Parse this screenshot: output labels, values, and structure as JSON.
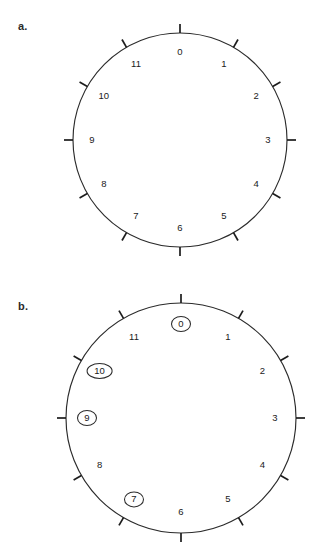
{
  "figure": {
    "background_color": "#ffffff",
    "line_color": "#2b2b2b",
    "text_color": "#1a1a1a"
  },
  "panels": [
    {
      "id": "a",
      "label": "a.",
      "label_x": 18,
      "label_y": 20,
      "dial": {
        "center_x": 180,
        "center_y": 140,
        "radius": 107,
        "tick_inner_offset": 0,
        "tick_outer_offset": 9,
        "label_inset": 19
      },
      "hours": [
        {
          "value": "0",
          "angle_deg": 0,
          "marked": false
        },
        {
          "value": "1",
          "angle_deg": 30,
          "marked": false
        },
        {
          "value": "2",
          "angle_deg": 60,
          "marked": false
        },
        {
          "value": "3",
          "angle_deg": 90,
          "marked": false
        },
        {
          "value": "4",
          "angle_deg": 120,
          "marked": false
        },
        {
          "value": "5",
          "angle_deg": 150,
          "marked": false
        },
        {
          "value": "6",
          "angle_deg": 180,
          "marked": false
        },
        {
          "value": "7",
          "angle_deg": 210,
          "marked": false
        },
        {
          "value": "8",
          "angle_deg": 240,
          "marked": false
        },
        {
          "value": "9",
          "angle_deg": 270,
          "marked": false
        },
        {
          "value": "10",
          "angle_deg": 300,
          "marked": false
        },
        {
          "value": "11",
          "angle_deg": 330,
          "marked": false
        }
      ]
    },
    {
      "id": "b",
      "label": "b.",
      "label_x": 18,
      "label_y": 300,
      "dial": {
        "center_x": 181,
        "center_y": 418,
        "radius": 115,
        "tick_inner_offset": 0,
        "tick_outer_offset": 9,
        "label_inset": 21
      },
      "hours": [
        {
          "value": "0",
          "angle_deg": 0,
          "marked": true
        },
        {
          "value": "1",
          "angle_deg": 30,
          "marked": false
        },
        {
          "value": "2",
          "angle_deg": 60,
          "marked": false
        },
        {
          "value": "3",
          "angle_deg": 90,
          "marked": false
        },
        {
          "value": "4",
          "angle_deg": 120,
          "marked": false
        },
        {
          "value": "5",
          "angle_deg": 150,
          "marked": false
        },
        {
          "value": "6",
          "angle_deg": 180,
          "marked": false
        },
        {
          "value": "7",
          "angle_deg": 210,
          "marked": true
        },
        {
          "value": "8",
          "angle_deg": 240,
          "marked": false
        },
        {
          "value": "9",
          "angle_deg": 270,
          "marked": true
        },
        {
          "value": "10",
          "angle_deg": 300,
          "marked": true
        },
        {
          "value": "11",
          "angle_deg": 330,
          "marked": false
        }
      ]
    }
  ]
}
